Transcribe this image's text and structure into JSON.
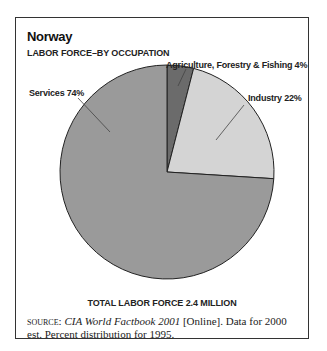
{
  "chart_data": {
    "type": "pie",
    "title": "Norway",
    "subtitle": "LABOR FORCE–BY OCCUPATION",
    "categories": [
      "Agriculture, Forestry & Fishing",
      "Industry",
      "Services"
    ],
    "values": [
      4,
      22,
      74
    ],
    "unit": "%",
    "labels": [
      "Agriculture, Forestry & Fishing 4%",
      "Industry 22%",
      "Services 74%"
    ],
    "colors": [
      "#6b6b6b",
      "#d4d4d4",
      "#9a9a9a"
    ],
    "footer": "TOTAL LABOR FORCE 2.4 MILLION",
    "legend": "none (direct labels with leader lines)"
  },
  "source": {
    "prefix": "SOURCE:",
    "title": "CIA World Factbook 2001",
    "rest": " [Online]. Data for 2000 est. Percent distribution for 1995."
  }
}
